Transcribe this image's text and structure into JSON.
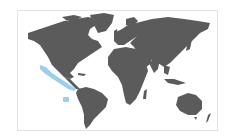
{
  "map": {
    "type": "world-distribution-map",
    "projection": "equirectangular",
    "land_color": "#5b5b5b",
    "highlight_color": "#8fcdec",
    "background_color": "#ffffff",
    "frame_color": "#e2e2e2",
    "highlighted_regions": [
      {
        "name": "pacific-coast-mexico-central-america",
        "description": "Eastern Pacific coastal range from Baja California to Panama"
      },
      {
        "name": "offshore-island-patch",
        "description": "Small patch offshore in the eastern tropical Pacific"
      }
    ]
  }
}
